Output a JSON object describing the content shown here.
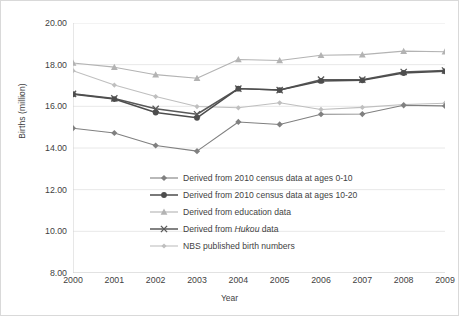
{
  "chart_data": {
    "type": "line",
    "title": "",
    "xlabel": "Year",
    "ylabel": "Births (million)",
    "categories": [
      "2000",
      "2001",
      "2002",
      "2003",
      "2004",
      "2005",
      "2006",
      "2007",
      "2008",
      "2009"
    ],
    "x": [
      2000,
      2001,
      2002,
      2003,
      2004,
      2005,
      2006,
      2007,
      2008,
      2009
    ],
    "xlim": [
      2000,
      2009
    ],
    "ylim": [
      8.0,
      20.0
    ],
    "ytick_labels": [
      "20.00",
      "18.00",
      "16.00",
      "14.00",
      "12.00",
      "10.00",
      "8.00"
    ],
    "yticks": [
      20.0,
      18.0,
      16.0,
      14.0,
      12.0,
      10.0,
      8.0
    ],
    "grid": "horizontal",
    "legend_position": "inside-lower-center",
    "series": [
      {
        "name": "Derived from 2010 census data at ages 0-10",
        "marker": "diamond",
        "color": "#808080",
        "values": [
          14.95,
          14.72,
          14.12,
          13.85,
          15.25,
          15.13,
          15.62,
          15.63,
          16.05,
          16.02
        ]
      },
      {
        "name": "Derived from 2010 census data at ages 10-20",
        "marker": "circle",
        "color": "#4d4d4d",
        "values": [
          16.58,
          16.35,
          15.7,
          15.45,
          16.85,
          16.78,
          17.22,
          17.25,
          17.6,
          17.68
        ]
      },
      {
        "name": "Derived from education data",
        "marker": "triangle",
        "color": "#b3b3b3",
        "values": [
          18.08,
          17.88,
          17.52,
          17.35,
          18.25,
          18.2,
          18.45,
          18.48,
          18.65,
          18.62
        ]
      },
      {
        "name": "Derived from Hukou data",
        "marker": "x",
        "color": "#595959",
        "values": [
          16.6,
          16.38,
          15.88,
          15.62,
          16.85,
          16.78,
          17.28,
          17.28,
          17.65,
          17.72
        ]
      },
      {
        "name": "NBS published birth numbers",
        "marker": "small-diamond",
        "color": "#bfbfbf",
        "values": [
          17.71,
          17.02,
          16.47,
          15.99,
          15.93,
          16.17,
          15.85,
          15.95,
          16.09,
          16.15
        ]
      }
    ]
  },
  "legend": {
    "items": [
      {
        "label": "Derived from 2010 census data at ages 0-10",
        "marker": "diamond",
        "color": "#808080"
      },
      {
        "label": "Derived from 2010 census data at ages 10-20",
        "marker": "circle",
        "color": "#4d4d4d"
      },
      {
        "label": "Derived from education data",
        "marker": "triangle",
        "color": "#b3b3b3"
      },
      {
        "label": "Derived from Hukou data",
        "marker": "x",
        "color": "#595959",
        "italic_word": "Hukou"
      },
      {
        "label": "NBS published birth numbers",
        "marker": "small-diamond",
        "color": "#bfbfbf"
      }
    ]
  },
  "axes": {
    "x_title": "Year",
    "y_title": "Births (million)"
  }
}
